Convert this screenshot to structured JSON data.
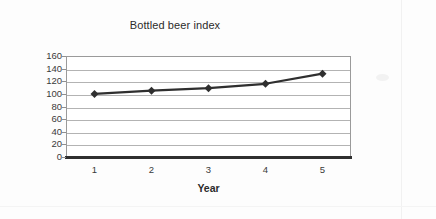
{
  "chart_data": {
    "type": "line",
    "title": "Bottled beer index",
    "xlabel": "Year",
    "ylabel": "",
    "x": [
      1,
      2,
      3,
      4,
      5
    ],
    "xtick_labels": [
      "1",
      "2",
      "3",
      "4",
      "5"
    ],
    "categories": [
      "1",
      "2",
      "3",
      "4",
      "5"
    ],
    "values": [
      100,
      105,
      109,
      116,
      132
    ],
    "series": [
      {
        "name": "Bottled beer index",
        "values": [
          100,
          105,
          109,
          116,
          132
        ]
      }
    ],
    "ylim": [
      0,
      160
    ],
    "xlim": [
      0.5,
      5.5
    ],
    "ytick_labels": [
      "0",
      "20",
      "40",
      "60",
      "80",
      "100",
      "120",
      "140",
      "160"
    ],
    "ytick_values": [
      0,
      20,
      40,
      60,
      80,
      100,
      120,
      140,
      160
    ],
    "grid": "horizontal",
    "legend": "none",
    "marker": "diamond",
    "line_color": "#2f2f2f",
    "marker_color": "#2f2f2f",
    "grid_color": "#b3b3b3",
    "axis_color": "#2f2f2f",
    "plot_background": "#ffffff",
    "figure_background": "#fdfdfd"
  }
}
